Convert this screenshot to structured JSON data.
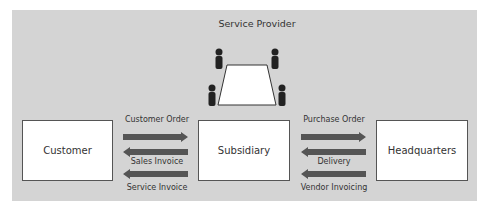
{
  "diagram": {
    "title": "Service Provider",
    "nodes": {
      "customer": "Customer",
      "subsidiary": "Subsidiary",
      "headquarters": "Headquarters"
    },
    "left_flows": [
      {
        "label": "Customer Order",
        "direction": "right"
      },
      {
        "label": "Sales Invoice",
        "direction": "left"
      },
      {
        "label": "Service Invoice",
        "direction": "left"
      }
    ],
    "right_flows": [
      {
        "label": "Purchase Order",
        "direction": "right"
      },
      {
        "label": "Delivery",
        "direction": "left"
      },
      {
        "label": "Vendor Invoicing",
        "direction": "left"
      }
    ],
    "colors": {
      "background": "#d4d4d4",
      "arrow": "#555555",
      "box": "#ffffff"
    }
  }
}
